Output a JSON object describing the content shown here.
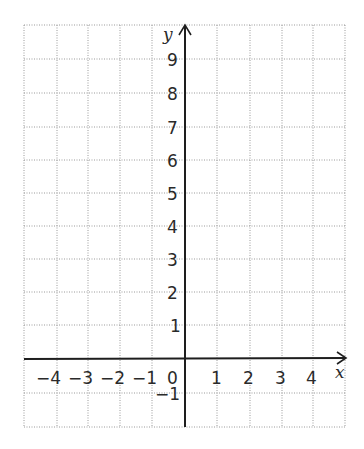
{
  "diagram": {
    "type": "coordinate-grid",
    "x_axis": {
      "label": "x",
      "range": [
        -5,
        5
      ],
      "tick_labels": [
        "−4",
        "−3",
        "−2",
        "−1",
        "0",
        "1",
        "2",
        "3",
        "4"
      ]
    },
    "y_axis": {
      "label": "y",
      "range": [
        -2,
        10
      ],
      "tick_labels": [
        "9",
        "8",
        "7",
        "6",
        "5",
        "4",
        "3",
        "2",
        "1",
        "−1"
      ]
    },
    "grid": "dotted",
    "colors": {
      "axis": "#1e1e1e",
      "grid": "#9a9a9a",
      "text": "#2a2a2a"
    }
  }
}
